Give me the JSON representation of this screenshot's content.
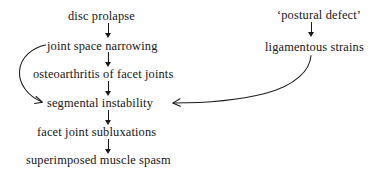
{
  "diagram": {
    "background_color": "#ffffff",
    "ink_color": "#1a1a1a",
    "nodes": [
      {
        "id": "disc_prolapse",
        "label": "disc prolapse"
      },
      {
        "id": "joint_space_narrowing",
        "label": "joint space narrowing"
      },
      {
        "id": "osteoarthritis",
        "label": "osteoarthritis of facet joints"
      },
      {
        "id": "segmental_instability",
        "label": "segmental instability"
      },
      {
        "id": "facet_joint_subluxations",
        "label": "facet joint subluxations"
      },
      {
        "id": "muscle_spasm",
        "label": "superimposed muscle spasm"
      },
      {
        "id": "postural_defect",
        "label": "‘postural defect’"
      },
      {
        "id": "ligamentous_strains",
        "label": "ligamentous strains"
      }
    ],
    "edges": [
      {
        "from": "disc_prolapse",
        "to": "joint_space_narrowing",
        "style": "straight-down"
      },
      {
        "from": "joint_space_narrowing",
        "to": "osteoarthritis",
        "style": "straight-down"
      },
      {
        "from": "osteoarthritis",
        "to": "segmental_instability",
        "style": "straight-down"
      },
      {
        "from": "segmental_instability",
        "to": "facet_joint_subluxations",
        "style": "straight-down"
      },
      {
        "from": "facet_joint_subluxations",
        "to": "muscle_spasm",
        "style": "straight-down"
      },
      {
        "from": "joint_space_narrowing",
        "to": "segmental_instability",
        "style": "curve-left-bypass"
      },
      {
        "from": "postural_defect",
        "to": "ligamentous_strains",
        "style": "straight-down"
      },
      {
        "from": "ligamentous_strains",
        "to": "segmental_instability",
        "style": "curve-long-right-to-left"
      }
    ]
  }
}
